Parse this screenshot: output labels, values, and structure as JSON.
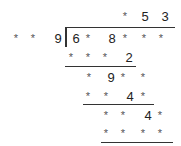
{
  "puzzle": {
    "type": "long-division-cryptarithm",
    "quotient": [
      "*",
      "5",
      "3"
    ],
    "divisor": [
      "*",
      "*",
      "9"
    ],
    "dividend": [
      "6",
      "*",
      "8",
      "*",
      "*",
      "*"
    ],
    "steps": [
      [
        "*",
        "*",
        "*",
        "2"
      ],
      [
        "*",
        "9",
        "*",
        "*"
      ],
      [
        "*",
        "*",
        "4",
        "*"
      ],
      [
        "*",
        "*",
        "4",
        "*"
      ],
      [
        "*",
        "*",
        "*",
        "*"
      ]
    ]
  }
}
